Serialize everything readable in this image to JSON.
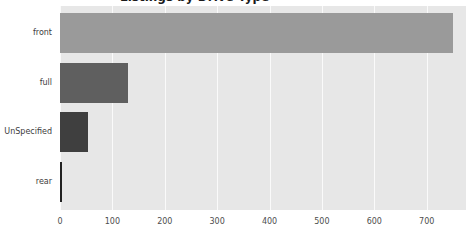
{
  "figure": {
    "title": "Listings by Drive Type",
    "title_clipped": true,
    "background": "#ffffff",
    "plot_background": "#e7e7e7",
    "gridline_color": "#fafafa",
    "label_color": "#3c3c3c",
    "tick_color": "#4d4d4d"
  },
  "chart_data": {
    "type": "bar",
    "orientation": "horizontal",
    "categories": [
      "front",
      "full",
      "UnSpecified",
      "rear"
    ],
    "values": [
      750,
      130,
      54,
      3
    ],
    "bar_colors": [
      "#9a9a9a",
      "#5f5f5f",
      "#3f3f3f",
      "#222222"
    ],
    "xticks": [
      0,
      100,
      200,
      300,
      400,
      500,
      600,
      700
    ],
    "xlim": [
      0,
      775
    ],
    "xlabel": "",
    "ylabel": "",
    "grid": "vertical-white-gridlines",
    "legend": false
  }
}
